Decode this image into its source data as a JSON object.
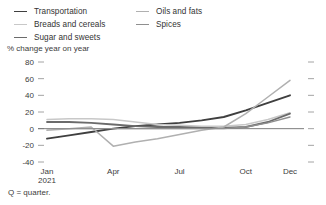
{
  "legend": {
    "columns": [
      {
        "items": [
          {
            "label": "Transportation",
            "color": "#3f3f3f"
          },
          {
            "label": "Breads and cereals",
            "color": "#c8c8c8"
          },
          {
            "label": "Sugar and sweets",
            "color": "#6b6b6b"
          }
        ]
      },
      {
        "items": [
          {
            "label": "Oils and fats",
            "color": "#b0b0b0"
          },
          {
            "label": "Spices",
            "color": "#8f8f8f"
          }
        ]
      }
    ]
  },
  "footnote": "Q = quarter.",
  "chart_data": {
    "type": "line",
    "title": "",
    "subtitle": "% change year on year",
    "ylabel": "% change year on year",
    "xlabel": "",
    "grid": false,
    "legend_position": "top",
    "ylim": [
      -40,
      80
    ],
    "yticks": [
      80,
      60,
      40,
      20,
      0,
      -20,
      -40
    ],
    "ytick_labels": [
      "80",
      "60",
      "40",
      "20",
      "0",
      "-20",
      "-40"
    ],
    "xticks": [
      0,
      3,
      6,
      9,
      11
    ],
    "xtick_labels": [
      "Jan",
      "Apr",
      "Jul",
      "Oct",
      "Dec"
    ],
    "xtick_sublabels": [
      "2021",
      "",
      "",
      "",
      ""
    ],
    "x": [
      0,
      1,
      2,
      3,
      4,
      5,
      6,
      7,
      8,
      9,
      10,
      11
    ],
    "series": [
      {
        "name": "Transportation",
        "color": "#3f3f3f",
        "width": 1.9,
        "values": [
          -12,
          -8,
          -4,
          0,
          3,
          5,
          7,
          10,
          14,
          22,
          31,
          40
        ]
      },
      {
        "name": "Breads and cereals",
        "color": "#c8c8c8",
        "width": 1.5,
        "values": [
          11,
          12,
          12,
          11,
          8,
          5,
          4,
          3,
          3,
          5,
          11,
          19
        ]
      },
      {
        "name": "Sugar and sweets",
        "color": "#6b6b6b",
        "width": 1.8,
        "values": [
          8,
          8,
          7,
          5,
          3,
          2,
          2,
          1,
          1,
          2,
          8,
          18
        ]
      },
      {
        "name": "Oils and fats",
        "color": "#b0b0b0",
        "width": 1.5,
        "values": [
          -2,
          0,
          2,
          -21,
          -16,
          -12,
          -7,
          -2,
          2,
          18,
          38,
          58
        ]
      },
      {
        "name": "Spices",
        "color": "#8f8f8f",
        "width": 1.4,
        "values": [
          0,
          0,
          0,
          0,
          0,
          0,
          0,
          0,
          0,
          2,
          7,
          14
        ]
      }
    ]
  }
}
